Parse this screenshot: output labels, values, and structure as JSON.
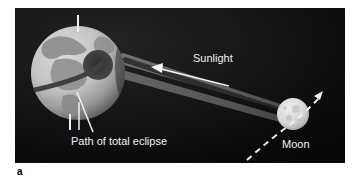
{
  "figure": {
    "panel_label": "a",
    "background_color": "#0d0d0d",
    "page_background": "#ffffff",
    "border_color": "#8a8a8a"
  },
  "labels": {
    "sunlight": "Sunlight",
    "path_of_total_eclipse": "Path of total eclipse",
    "moon": "Moon"
  },
  "objects": {
    "earth": {
      "name": "Earth",
      "center_x": 63,
      "center_y": 72,
      "radius": 47,
      "body_color": "#c9c9c9",
      "ocean_color": "#bdbdbd",
      "land_color": "#8f8f8f",
      "terminator_color": "#6e6e6e",
      "axis_color": "#f0f0f0",
      "umbra_spot_color": "#3a3a3a"
    },
    "moon": {
      "name": "Moon",
      "center_x": 293,
      "center_y": 113,
      "radius": 16,
      "body_color": "#dedede",
      "crater_color": "#c0c0c0"
    },
    "shadow_cone": {
      "penumbra_color": "#6d6d6d",
      "umbra_color": "#1a1a1a",
      "description": "Shadow bands converging from Earth to Moon"
    },
    "moon_orbit": {
      "style": "dashed",
      "color": "#f0f0f0",
      "arrow": "up-right"
    },
    "sunlight_arrow": {
      "direction": "left",
      "color": "#f2f2f2"
    },
    "eclipse_path_curve": {
      "color": "#4a4a4a"
    }
  }
}
